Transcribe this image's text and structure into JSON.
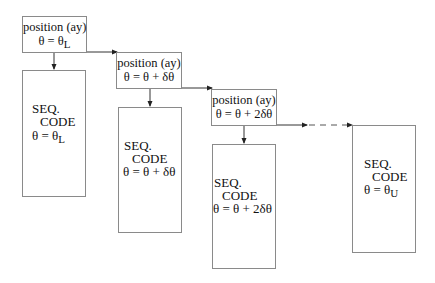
{
  "diagram": {
    "type": "flowchart",
    "stages": [
      {
        "position_box": {
          "title": "position (ay)",
          "theta_prefix": "θ = θ",
          "theta_sub": "L",
          "theta_suffix": ""
        },
        "seq_box": {
          "line1": "SEQ.",
          "line2": "CODE",
          "theta_prefix": "θ = θ",
          "theta_sub": "L",
          "theta_suffix": ""
        }
      },
      {
        "position_box": {
          "title": "position (ay)",
          "theta_prefix": "θ = θ + δθ",
          "theta_sub": "",
          "theta_suffix": ""
        },
        "seq_box": {
          "line1": "SEQ.",
          "line2": "CODE",
          "theta_prefix": "θ = θ + δθ",
          "theta_sub": "",
          "theta_suffix": ""
        }
      },
      {
        "position_box": {
          "title": "position (ay)",
          "theta_prefix": "θ = θ + 2δθ",
          "theta_sub": "",
          "theta_suffix": ""
        },
        "seq_box": {
          "line1": "SEQ.",
          "line2": "CODE",
          "theta_prefix": "θ = θ + 2δθ",
          "theta_sub": "",
          "theta_suffix": ""
        }
      },
      {
        "seq_box": {
          "line1": "SEQ.",
          "line2": "CODE",
          "theta_prefix": "θ = θ",
          "theta_sub": "U",
          "theta_suffix": ""
        }
      }
    ],
    "colors": {
      "box_border": "#8a8a8a",
      "arrow": "#222222",
      "text": "#111111"
    }
  }
}
